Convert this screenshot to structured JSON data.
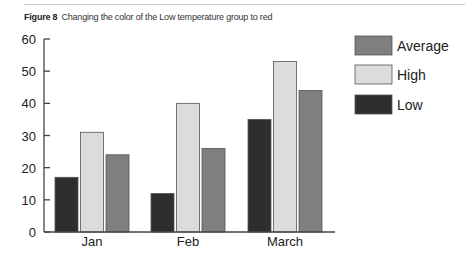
{
  "caption": {
    "label": "Figure 8",
    "text": "Changing the color of the Low temperature group to red"
  },
  "colors": {
    "Low": "#2e2e2e",
    "High": "#dcdcdc",
    "Average": "#7f7f7f",
    "axis": "#444444"
  },
  "chart_data": {
    "type": "bar",
    "title": "Changing the color of the Low temperature group to red",
    "categories": [
      "Jan",
      "Feb",
      "March"
    ],
    "series": [
      {
        "name": "Low",
        "values": [
          17,
          12,
          35
        ]
      },
      {
        "name": "High",
        "values": [
          31,
          40,
          53
        ]
      },
      {
        "name": "Average",
        "values": [
          24,
          26,
          44
        ]
      }
    ],
    "xlabel": "",
    "ylabel": "",
    "ylim": [
      0,
      60
    ],
    "yticks": [
      0,
      10,
      20,
      30,
      40,
      50,
      60
    ],
    "grid": false,
    "legend": {
      "position": "right",
      "entries": [
        "Average",
        "High",
        "Low"
      ]
    }
  }
}
